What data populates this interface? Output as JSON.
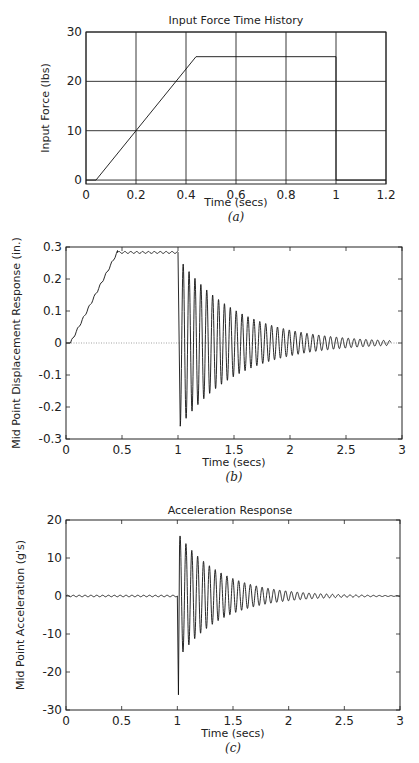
{
  "chart_data": [
    {
      "id": "a",
      "type": "line",
      "title": "Input Force Time History",
      "xlabel": "Time (secs)",
      "ylabel": "Input Force (lbs)",
      "caption": "(a)",
      "xlim": [
        0,
        1.2
      ],
      "ylim": [
        -0.8,
        30
      ],
      "xticks": [
        0,
        0.2,
        0.4,
        0.6,
        0.8,
        1,
        1.2
      ],
      "xtick_labels": [
        "0",
        "0.2",
        "0.4",
        "0.6",
        "0.8",
        "1",
        "1.2"
      ],
      "yticks": [
        0,
        10,
        20,
        30
      ],
      "ytick_labels": [
        "0",
        "10",
        "20",
        "30"
      ],
      "grid": true,
      "series": [
        {
          "name": "Input Force",
          "x": [
            0,
            0.04,
            0.44,
            1.0,
            1.0,
            1.2
          ],
          "y": [
            0,
            0,
            25,
            25,
            0,
            0
          ]
        }
      ]
    },
    {
      "id": "b",
      "type": "line",
      "title": "",
      "xlabel": "Time (secs)",
      "ylabel": "Mid Point Displacement Response (in.)",
      "caption": "(b)",
      "xlim": [
        0,
        3
      ],
      "ylim": [
        -0.3,
        0.3
      ],
      "xticks": [
        0,
        0.5,
        1,
        1.5,
        2,
        2.5,
        3
      ],
      "xtick_labels": [
        "0",
        "0.5",
        "1",
        "1.5",
        "2",
        "2.5",
        "3"
      ],
      "yticks": [
        -0.3,
        -0.2,
        -0.1,
        0,
        0.1,
        0.2,
        0.3
      ],
      "ytick_labels": [
        "-0.3",
        "-0.2",
        "-0.1",
        "0",
        "0.1",
        "0.2",
        "0.3"
      ],
      "grid": false,
      "zero_line": "dotted",
      "series": [
        {
          "name": "Displacement",
          "ramp": {
            "t_start": 0.04,
            "t_end": 0.46,
            "y_end": 0.285
          },
          "hold": {
            "t_end": 1.0,
            "y": 0.283,
            "ripple": 0.003
          },
          "free_vibration": {
            "t_start": 1.02,
            "peak": 0.26,
            "frequency_hz": 19,
            "decay_rate": 1.9,
            "t_end": 2.9,
            "initial_value": -0.26
          }
        }
      ]
    },
    {
      "id": "c",
      "type": "line",
      "title": "Acceleration Response",
      "xlabel": "Time (secs)",
      "ylabel": "Mid Point Acceleration (g's)",
      "caption": "(c)",
      "xlim": [
        0,
        3
      ],
      "ylim": [
        -30,
        20
      ],
      "xticks": [
        0,
        0.5,
        1,
        1.5,
        2,
        2.5,
        3
      ],
      "xtick_labels": [
        "0",
        "0.5",
        "1",
        "1.5",
        "2",
        "2.5",
        "3"
      ],
      "yticks": [
        -30,
        -20,
        -10,
        0,
        10,
        20
      ],
      "ytick_labels": [
        "-30",
        "-20",
        "-10",
        "0",
        "10",
        "20"
      ],
      "grid": false,
      "series": [
        {
          "name": "Acceleration",
          "pre_ripple": 0.2,
          "spike": {
            "t": 1.01,
            "min": -26
          },
          "free_vibration": {
            "t_start": 1.02,
            "peak": 16,
            "frequency_hz": 19,
            "decay_rate": 2.6,
            "t_end": 3.0
          }
        }
      ]
    }
  ]
}
